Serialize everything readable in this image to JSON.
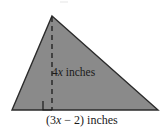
{
  "figure": {
    "type": "triangle-geometry-diagram",
    "background_color": "#ffffff",
    "fill_color": "#8a8a8a",
    "stroke_color": "#2b2b2b",
    "dash_color": "#1c1c1c",
    "text_color": "#1a1a1a",
    "vertices": {
      "apex": {
        "x": 52,
        "y": 16
      },
      "bottom_left": {
        "x": 12,
        "y": 110
      },
      "bottom_right": {
        "x": 158,
        "y": 110
      }
    },
    "altitude": {
      "from": {
        "x": 52,
        "y": 16
      },
      "to": {
        "x": 52,
        "y": 110
      },
      "style": "dashed",
      "right_angle_marker": {
        "x": 43,
        "y": 101,
        "size": 9
      }
    },
    "labels": {
      "height": {
        "text": "4x inches",
        "prefix": "4",
        "variable": "x",
        "suffix": " inches"
      },
      "base": {
        "text": "(3x − 2) inches",
        "open": "(3",
        "variable": "x",
        "middle": " − 2) ",
        "suffix": "inches"
      }
    }
  }
}
